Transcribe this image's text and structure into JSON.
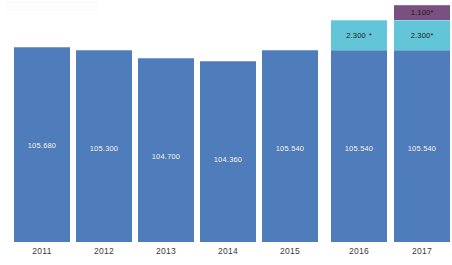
{
  "chart_data": {
    "type": "bar",
    "title": "",
    "subtitle": "",
    "xlabel": "",
    "ylabel": "",
    "grid": false,
    "legend": "none",
    "stacked": true,
    "ylim": [
      0,
      112000
    ],
    "categories": [
      "2011",
      "2012",
      "2013",
      "2014",
      "2015",
      "2016",
      "2017"
    ],
    "series": [
      {
        "name": "base",
        "color": "#4f7cba",
        "values": [
          105680,
          105300,
          104700,
          104360,
          105540,
          105540,
          105540
        ],
        "labels": [
          "105.680",
          "105.300",
          "104.700",
          "104.360",
          "105.540",
          "105.540",
          "105.540"
        ]
      },
      {
        "name": "addition-teal",
        "color": "#63c5d8",
        "values": [
          null,
          null,
          null,
          null,
          null,
          2300,
          2300
        ],
        "labels": [
          null,
          null,
          null,
          null,
          null,
          "2.300",
          "2.300"
        ]
      },
      {
        "name": "addition-purple",
        "color": "#7a5080",
        "values": [
          null,
          null,
          null,
          null,
          null,
          null,
          1100
        ],
        "labels": [
          null,
          null,
          null,
          null,
          null,
          null,
          "1.100"
        ]
      }
    ],
    "footnote_marker": "*"
  },
  "bars": [
    {
      "category": "2011",
      "left": 14,
      "segments": [
        {
          "kind": "base",
          "height": 195,
          "label": "105.680",
          "star": false
        }
      ]
    },
    {
      "category": "2012",
      "left": 76,
      "segments": [
        {
          "kind": "base",
          "height": 192,
          "label": "105.300",
          "star": false
        }
      ]
    },
    {
      "category": "2013",
      "left": 138,
      "segments": [
        {
          "kind": "base",
          "height": 184,
          "label": "104.700",
          "star": false
        }
      ]
    },
    {
      "category": "2014",
      "left": 200,
      "segments": [
        {
          "kind": "base",
          "height": 181,
          "label": "104.360",
          "star": false
        }
      ]
    },
    {
      "category": "2015",
      "left": 262,
      "segments": [
        {
          "kind": "base",
          "height": 192,
          "label": "105.540",
          "star": false
        }
      ]
    },
    {
      "category": "2016",
      "left": 331,
      "segments": [
        {
          "kind": "base",
          "height": 192,
          "label": "105.540",
          "star": false
        },
        {
          "kind": "mid",
          "height": 30,
          "label": "2.300",
          "star": true,
          "starSpaced": true
        }
      ]
    },
    {
      "category": "2017",
      "left": 394,
      "segments": [
        {
          "kind": "base",
          "height": 192,
          "label": "105.540",
          "star": false
        },
        {
          "kind": "mid",
          "height": 30,
          "label": "2.300",
          "star": true,
          "starSpaced": false
        },
        {
          "kind": "top",
          "height": 15,
          "label": "1.100",
          "star": true,
          "starSpaced": false
        }
      ]
    }
  ],
  "axis": {
    "ticks": [
      {
        "label": "2011",
        "left": 14
      },
      {
        "label": "2012",
        "left": 76
      },
      {
        "label": "2013",
        "left": 138
      },
      {
        "label": "2014",
        "left": 200
      },
      {
        "label": "2015",
        "left": 262
      },
      {
        "label": "2016",
        "left": 331
      },
      {
        "label": "2017",
        "left": 394
      }
    ]
  }
}
